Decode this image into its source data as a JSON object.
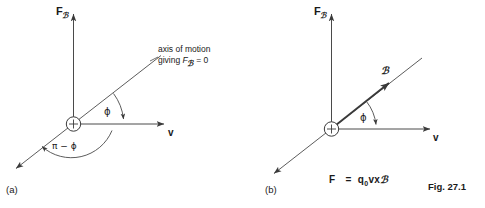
{
  "figure": {
    "caption": "Fig. 27.1",
    "panels": [
      {
        "id": "a",
        "label": "(a)",
        "vertical_axis_label_main": "F",
        "vertical_axis_label_sub": "ℬ",
        "velocity_label": "v",
        "angle_upper_label": "ϕ",
        "angle_lower_label": "π − ϕ",
        "annotation_line1": "axis of motion",
        "annotation_line2_prefix": "giving ",
        "annotation_line2_symbol": "F",
        "annotation_line2_sub": "ℬ",
        "annotation_line2_suffix": " = 0",
        "charge_symbol": "+"
      },
      {
        "id": "b",
        "label": "(b)",
        "vertical_axis_label_main": "F",
        "vertical_axis_label_sub": "ℬ",
        "velocity_label": "v",
        "angle_upper_label": "ϕ",
        "field_vector_label": "ℬ",
        "charge_symbol": "+",
        "equation_lhs": "F",
        "equation_eq": "=",
        "equation_rhs_q": "q",
        "equation_rhs_q_sub": "0",
        "equation_rhs_v": "v",
        "equation_rhs_cross": "x",
        "equation_rhs_B": "ℬ"
      }
    ]
  },
  "colors": {
    "background": "#ffffff",
    "ink": "#2b2b2b",
    "line": "#555555",
    "text": "#1a1a1a"
  }
}
